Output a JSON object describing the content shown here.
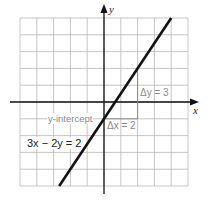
{
  "chart_data": {
    "type": "line",
    "title": "",
    "xlabel": "x",
    "ylabel": "y",
    "xlim": [
      -5,
      5
    ],
    "ylim": [
      -5,
      5
    ],
    "grid": true,
    "grid_step": 1,
    "series": [
      {
        "name": "3x - 2y = 2",
        "equation": "3x - 2y = 2",
        "slope": 1.5,
        "intercept": -1,
        "points": [
          [
            -2.6667,
            -5
          ],
          [
            4,
            5
          ]
        ]
      }
    ],
    "annotations": [
      {
        "text": "y-intercept",
        "point": [
          0,
          -1
        ]
      },
      {
        "text": "Δx = 2",
        "from": [
          0,
          -1
        ],
        "to": [
          2,
          -1
        ]
      },
      {
        "text": "Δy = 3",
        "from": [
          2,
          -1
        ],
        "to": [
          2,
          2
        ]
      },
      {
        "text": "3x - 2y = 2",
        "position": [
          -3.7,
          -2.3
        ]
      }
    ]
  },
  "labels": {
    "x_axis": "x",
    "y_axis": "y",
    "y_intercept": "y-intercept",
    "delta_x": "Δx = 2",
    "delta_y": "Δy = 3",
    "equation": "3x − 2y = 2"
  },
  "colors": {
    "grid": "#b8b8b8",
    "axis": "#111111",
    "line": "#111111",
    "annotation": "#8a8a8a"
  }
}
